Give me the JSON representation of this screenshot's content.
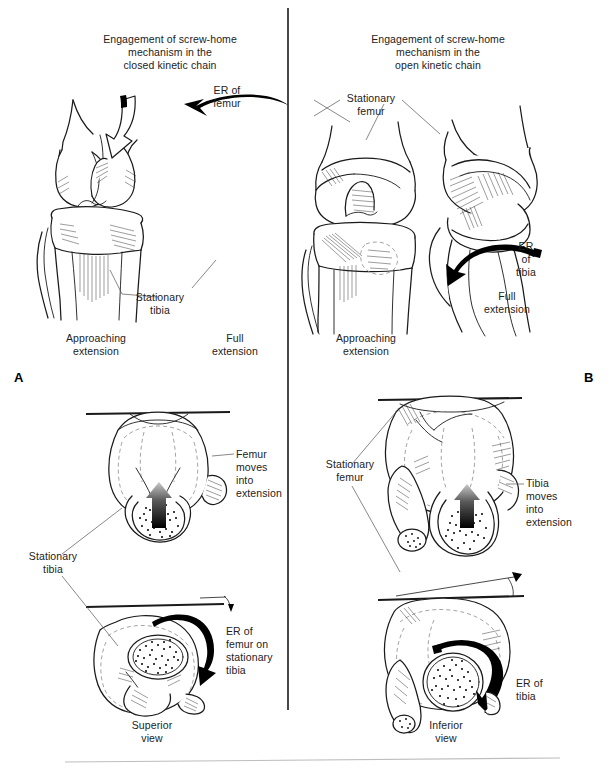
{
  "figure": {
    "panels": [
      {
        "id": "A",
        "letter": "A",
        "caption_lines": [
          "Engagement of screw-home",
          "mechanism in the",
          "closed kinetic chain"
        ],
        "views": [
          {
            "name": "approaching-extension",
            "label_lines": [
              "Approaching",
              "extension"
            ]
          },
          {
            "name": "full-extension",
            "label_lines": [
              "Full",
              "extension"
            ]
          },
          {
            "name": "superior-view",
            "label_lines": [
              "Superior",
              "view"
            ]
          }
        ],
        "annotations": [
          {
            "name": "er-of-femur",
            "lines": [
              "ER of",
              "femur"
            ]
          },
          {
            "name": "stationary-tibia-anterior",
            "lines": [
              "Stationary",
              "tibia"
            ]
          },
          {
            "name": "femur-moves-into-extension",
            "lines": [
              "Femur",
              "moves",
              "into",
              "extension"
            ]
          },
          {
            "name": "stationary-tibia-superior",
            "lines": [
              "Stationary",
              "tibia"
            ]
          },
          {
            "name": "er-of-femur-on-stationary-tibia",
            "lines": [
              "ER of",
              "femur on",
              "stationary",
              "tibia"
            ]
          }
        ]
      },
      {
        "id": "B",
        "letter": "B",
        "caption_lines": [
          "Engagement of screw-home",
          "mechanism in the",
          "open kinetic chain"
        ],
        "views": [
          {
            "name": "approaching-extension",
            "label_lines": [
              "Approaching",
              "extension"
            ]
          },
          {
            "name": "full-extension",
            "label_lines": [
              "Full",
              "extension"
            ]
          },
          {
            "name": "inferior-view",
            "label_lines": [
              "Inferior",
              "view"
            ]
          }
        ],
        "annotations": [
          {
            "name": "stationary-femur-anterior",
            "lines": [
              "Stationary",
              "femur"
            ]
          },
          {
            "name": "er-of-tibia-anterior",
            "lines": [
              "ER",
              "of",
              "tibia"
            ]
          },
          {
            "name": "stationary-femur-inferior",
            "lines": [
              "Stationary",
              "femur"
            ]
          },
          {
            "name": "tibia-moves-into-extension",
            "lines": [
              "Tibia",
              "moves",
              "into",
              "extension"
            ]
          },
          {
            "name": "er-of-tibia-inferior",
            "lines": [
              "ER of",
              "tibia"
            ]
          }
        ]
      }
    ],
    "colors": {
      "ink": "#1a1a1a",
      "label_text": "#222222",
      "dashed_outline": "#9a9a9a",
      "leader_line": "#555555",
      "footer_rule": "#bdbdbd",
      "background": "#ffffff"
    }
  }
}
